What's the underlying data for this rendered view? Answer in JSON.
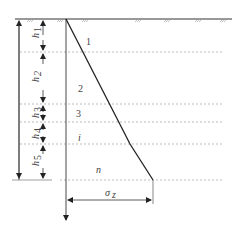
{
  "diagram": {
    "type": "stress-distribution-with-depth",
    "layers": [
      {
        "label": "1",
        "thickness_label": "h",
        "sub": "1"
      },
      {
        "label": "2",
        "thickness_label": "h",
        "sub": "2"
      },
      {
        "label": "3",
        "thickness_label": "h",
        "sub": "3"
      },
      {
        "label": "i",
        "thickness_label": "h",
        "sub": "4"
      },
      {
        "label": "n",
        "thickness_label": "h",
        "sub": "5"
      }
    ],
    "stress_label": "σ",
    "stress_sub": "z",
    "colors": {
      "line": "#222222",
      "dashed": "#aaaaaa",
      "text": "#444444"
    }
  }
}
